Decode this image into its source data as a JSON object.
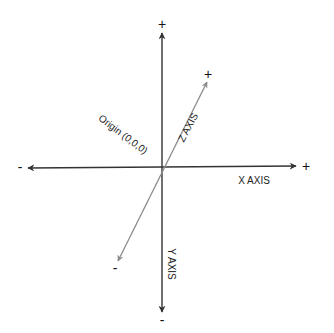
{
  "diagram": {
    "origin_label": "Origin (0,0,0)",
    "axes": {
      "x": {
        "label": "X AXIS",
        "positive": "+",
        "negative": "-",
        "color": "#333333"
      },
      "y": {
        "label": "Y AXIS",
        "positive": "+",
        "negative": "-",
        "color": "#333333"
      },
      "z": {
        "label": "Z AXIS",
        "positive": "+",
        "negative": "-",
        "color": "#8a8a8a"
      }
    }
  }
}
